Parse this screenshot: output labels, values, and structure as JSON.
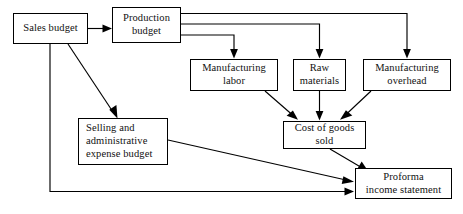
{
  "diagram": {
    "type": "flowchart",
    "canvas": {
      "width": 463,
      "height": 214
    },
    "style": {
      "background": "#ffffff",
      "box_border_color": "#000000",
      "line_color": "#000000",
      "text_color": "#111111"
    },
    "nodes": [
      {
        "id": "sales-budget",
        "label": "Sales budget",
        "x": 13,
        "y": 13,
        "w": 75,
        "h": 31,
        "align": "center"
      },
      {
        "id": "production-budget",
        "label": "Production\nbudget",
        "x": 112,
        "y": 7,
        "w": 69,
        "h": 36,
        "align": "center"
      },
      {
        "id": "manufacturing-labor",
        "label": "Manufacturing\nlabor",
        "x": 190,
        "y": 59,
        "w": 88,
        "h": 32,
        "align": "center"
      },
      {
        "id": "raw-materials",
        "label": "Raw\nmaterials",
        "x": 293,
        "y": 59,
        "w": 53,
        "h": 32,
        "align": "center"
      },
      {
        "id": "manufacturing-overhead",
        "label": "Manufacturing\noverhead",
        "x": 363,
        "y": 59,
        "w": 88,
        "h": 32,
        "align": "center"
      },
      {
        "id": "selling-administrative-expense-budget",
        "label": "Selling and\nadministrative\nexpense budget",
        "x": 78,
        "y": 118,
        "w": 90,
        "h": 47,
        "align": "left"
      },
      {
        "id": "cost-of-goods-sold",
        "label": "Cost of goods\nsold",
        "x": 283,
        "y": 121,
        "w": 83,
        "h": 28,
        "align": "center"
      },
      {
        "id": "proforma-income-statement",
        "label": "Proforma\nincome statement",
        "x": 355,
        "y": 168,
        "w": 97,
        "h": 31,
        "align": "center"
      }
    ],
    "edges": [
      {
        "id": "sales-to-production",
        "from": "sales-budget",
        "to": "production-budget"
      },
      {
        "id": "production-to-manufacturing-labor",
        "from": "production-budget",
        "to": "manufacturing-labor"
      },
      {
        "id": "production-to-raw-materials",
        "from": "production-budget",
        "to": "raw-materials"
      },
      {
        "id": "production-to-manufacturing-overhead",
        "from": "production-budget",
        "to": "manufacturing-overhead"
      },
      {
        "id": "manufacturing-labor-to-cogs",
        "from": "manufacturing-labor",
        "to": "cost-of-goods-sold"
      },
      {
        "id": "raw-materials-to-cogs",
        "from": "raw-materials",
        "to": "cost-of-goods-sold"
      },
      {
        "id": "manufacturing-overhead-to-cogs",
        "from": "manufacturing-overhead",
        "to": "cost-of-goods-sold"
      },
      {
        "id": "sales-to-selling-admin",
        "from": "sales-budget",
        "to": "selling-administrative-expense-budget"
      },
      {
        "id": "selling-admin-to-proforma",
        "from": "selling-administrative-expense-budget",
        "to": "proforma-income-statement"
      },
      {
        "id": "cogs-to-proforma",
        "from": "cost-of-goods-sold",
        "to": "proforma-income-statement"
      },
      {
        "id": "sales-to-proforma",
        "from": "sales-budget",
        "to": "proforma-income-statement"
      }
    ]
  }
}
